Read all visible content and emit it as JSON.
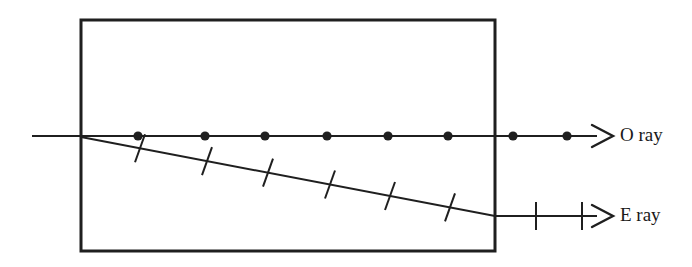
{
  "figure": {
    "background_color": "#ffffff",
    "stroke_color": "#1f1f1f",
    "width": 692,
    "height": 267
  },
  "crystal": {
    "label": "crystal-slab",
    "x": 81,
    "y": 20,
    "width": 414,
    "height": 231,
    "stroke_width": 3
  },
  "o_ray": {
    "label": "O ray",
    "y": 136,
    "x_start": 32,
    "x_end": 595,
    "stroke_width": 2,
    "marker": "filled-circle",
    "marker_radius": 4.6,
    "marker_x_positions": [
      138,
      205,
      265,
      327,
      388,
      448,
      513,
      567
    ],
    "arrow_tip_x": 611,
    "label_x": 620,
    "label_y": 136
  },
  "e_ray": {
    "label": "E ray",
    "x_start": 81,
    "y_start": 137,
    "x_exit": 495,
    "y_exit": 216,
    "x_end": 595,
    "y_end": 216,
    "stroke_width": 2,
    "marker": "tick-slash",
    "inside_tick_x_positions": [
      140,
      207,
      268,
      330,
      390,
      450
    ],
    "outside_tick_x_positions": [
      536,
      582
    ],
    "tick_half_length": 14,
    "arrow_tip_x": 611,
    "label_x": 620,
    "label_y": 216
  }
}
